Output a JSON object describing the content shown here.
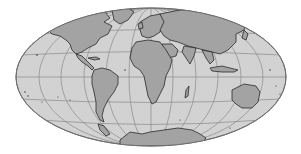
{
  "map": {
    "projection": "elliptical-world",
    "colors": {
      "background": "#ffffff",
      "ocean": "#d2d2d2",
      "land": "#a3a3a3",
      "coast": "#2a2a2a",
      "graticule": "#8a8a8a",
      "rim": "#6e6e6e"
    },
    "regions": [
      {
        "name": "north-america"
      },
      {
        "name": "greenland"
      },
      {
        "name": "central-america"
      },
      {
        "name": "south-america"
      },
      {
        "name": "europe"
      },
      {
        "name": "africa"
      },
      {
        "name": "asia"
      },
      {
        "name": "arabia"
      },
      {
        "name": "india"
      },
      {
        "name": "southeast-asia"
      },
      {
        "name": "japan"
      },
      {
        "name": "indonesia"
      },
      {
        "name": "australia"
      },
      {
        "name": "new-zealand"
      },
      {
        "name": "madagascar"
      },
      {
        "name": "antarctica"
      },
      {
        "name": "british-isles"
      }
    ]
  }
}
